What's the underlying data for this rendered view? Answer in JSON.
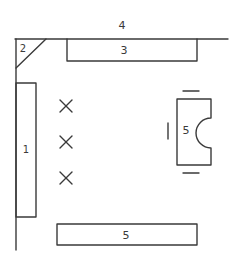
{
  "diagram": {
    "type": "floor-plan-sketch",
    "stroke_color": "#3a3a3a",
    "background": "#ffffff",
    "elements": [
      {
        "id": "1",
        "label": "1",
        "kind": "long-rectangle-left",
        "note": "furniture along left wall"
      },
      {
        "id": "2",
        "label": "2",
        "kind": "corner-triangle",
        "note": "corner piece at top-left"
      },
      {
        "id": "3",
        "label": "3",
        "kind": "rectangle-top",
        "note": "furniture along top wall"
      },
      {
        "id": "4",
        "label": "4",
        "kind": "wall-label",
        "note": "top wall"
      },
      {
        "id": "5a",
        "label": "5",
        "kind": "desk-with-notch",
        "note": "desk with semicircle cut-out and seat marks"
      },
      {
        "id": "5b",
        "label": "5",
        "kind": "rectangle-bottom",
        "note": "bench near bottom"
      }
    ],
    "markers": [
      {
        "symbol": "×",
        "kind": "x-mark"
      },
      {
        "symbol": "×",
        "kind": "x-mark"
      },
      {
        "symbol": "×",
        "kind": "x-mark"
      }
    ]
  }
}
